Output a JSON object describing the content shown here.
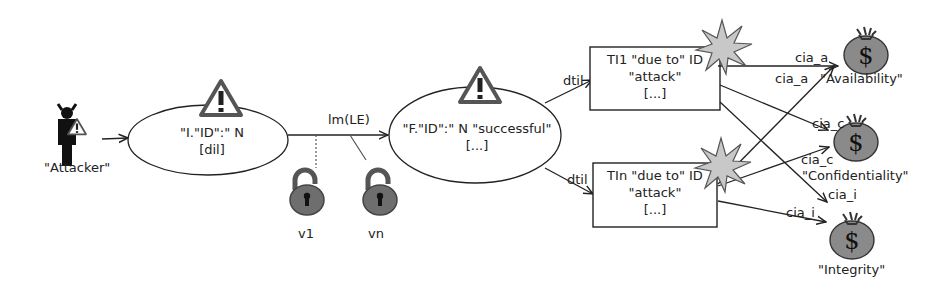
{
  "diagram": {
    "type": "attack-tree / threat propagation diagram",
    "attacker": {
      "label": "\"Attacker\""
    },
    "initial_state": {
      "line1": "\"I.\"ID\":\" N",
      "line2": "[dil]"
    },
    "transition": {
      "label": "lm(LE)"
    },
    "vulnerabilities": [
      {
        "label": "v1"
      },
      {
        "label": "vn"
      }
    ],
    "final_state": {
      "line1": "\"F.\"ID\":\" N \"successful\"",
      "line2": "[...]"
    },
    "threat_instances": [
      {
        "line1": "TI1 \"due to\" ID",
        "line2": "\"attack\"",
        "line3": "[...]",
        "edge_label": "dtil"
      },
      {
        "line1": "TIn \"due to\" ID",
        "line2": "\"attack\"",
        "line3": "[...]",
        "edge_label": "dtil"
      }
    ],
    "assets": [
      {
        "label": "\"Availability\"",
        "edge_labels": [
          "cia_a",
          "cia_a"
        ]
      },
      {
        "label": "\"Confidentiality\"",
        "edge_labels": [
          "cia_c",
          "cia_c"
        ]
      },
      {
        "label": "\"Integrity\"",
        "edge_labels": [
          "cia_i",
          "cia_i"
        ]
      }
    ],
    "icons": [
      "attacker-devil-icon",
      "warning-triangle-icon",
      "open-padlock-icon",
      "explosion-star-icon",
      "money-bag-icon"
    ],
    "colors": {
      "stroke": "#222222",
      "icon_fill": "#6e6e6e",
      "star_fill": "#c8c8c8",
      "bag_fill": "#8a8a8a"
    }
  }
}
